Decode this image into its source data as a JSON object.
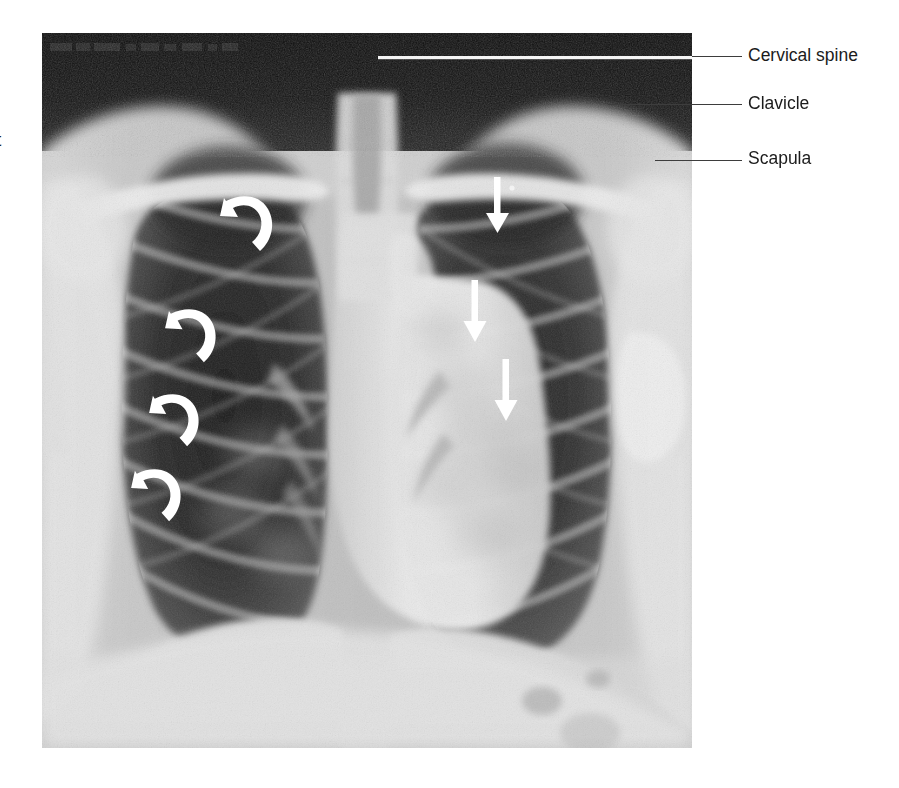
{
  "figure": {
    "type": "chest-radiograph",
    "view": "PA (posteroanterior) chest X-ray",
    "margin_text": "t",
    "plate_header_text": "",
    "background_color": "#ffffff",
    "plate_bounds": {
      "x": 42,
      "y": 33,
      "width": 650,
      "height": 715
    }
  },
  "annotations": {
    "labels": [
      {
        "text": "Cervical spine",
        "x": 748,
        "y": 47,
        "leader_from_x": 692,
        "leader_to_x": 742,
        "leader_y": 56,
        "inner_leader_from_x": 378,
        "inner_leader_to_x": 692,
        "inner_leader_y": 58
      },
      {
        "text": "Clavicle",
        "x": 748,
        "y": 95,
        "leader_from_x": 608,
        "leader_to_x": 742,
        "leader_y": 104
      },
      {
        "text": "Scapula",
        "x": 748,
        "y": 150,
        "leader_from_x": 655,
        "leader_to_x": 742,
        "leader_y": 160
      }
    ],
    "straight_arrows": {
      "color": "#ffffff",
      "direction": "down",
      "description": "White straight arrows marking the right lung field",
      "items": [
        {
          "id": "arrow-1",
          "x": 498,
          "y_start": 177,
          "y_tip": 224
        },
        {
          "id": "arrow-2",
          "x": 475,
          "y_start": 280,
          "y_tip": 334
        },
        {
          "id": "arrow-3",
          "x": 506,
          "y_start": 359,
          "y_tip": 413
        }
      ]
    },
    "curved_arrows": {
      "color": "#ffffff",
      "description": "White curved (hooked) arrowheads marking the left lung field",
      "items": [
        {
          "id": "curved-arrow-1",
          "x": 222,
          "y": 212,
          "scale": 1.0,
          "rotation": 0
        },
        {
          "id": "curved-arrow-2",
          "x": 167,
          "y": 325,
          "scale": 0.97,
          "rotation": 0
        },
        {
          "id": "curved-arrow-3",
          "x": 151,
          "y": 410,
          "scale": 0.95,
          "rotation": 0
        },
        {
          "id": "curved-arrow-4",
          "x": 133,
          "y": 485,
          "scale": 0.95,
          "rotation": 0
        }
      ]
    }
  },
  "colors": {
    "page_background": "#ffffff",
    "label_text": "#1b1b1b",
    "leader_line": "#3d3d3d",
    "arrow_white": "#ffffff",
    "plate_dark": "#1c1c1c",
    "plate_mid": "#8d8d8d",
    "plate_light": "#efefef"
  }
}
